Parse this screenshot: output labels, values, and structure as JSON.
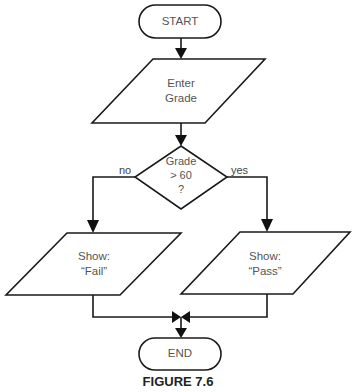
{
  "figure": {
    "caption": "FIGURE 7.6"
  },
  "nodes": {
    "start": {
      "type": "terminator",
      "label": "START"
    },
    "input": {
      "type": "input-output",
      "label": "Enter\nGrade"
    },
    "decision": {
      "type": "decision",
      "label": "Grade\n> 60\n?"
    },
    "fail": {
      "type": "input-output",
      "label": "Show:\n“Fail”"
    },
    "pass": {
      "type": "input-output",
      "label": "Show:\n“Pass”"
    },
    "end": {
      "type": "terminator",
      "label": "END"
    }
  },
  "edges": {
    "no_label": "no",
    "yes_label": "yes"
  },
  "colors": {
    "stroke": "#1a1a1a",
    "text": "#555555",
    "background": "#ffffff"
  }
}
